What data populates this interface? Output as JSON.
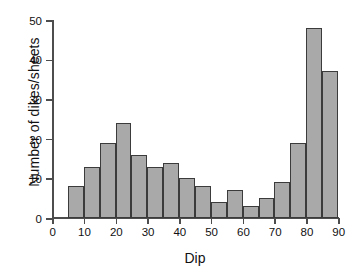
{
  "chart_data": {
    "type": "bar",
    "title": "",
    "subtitle": "",
    "xlabel": "Dip",
    "ylabel": "Number of dikes/sheets",
    "xlim": [
      0,
      90
    ],
    "ylim": [
      0,
      50
    ],
    "xticks": [
      0,
      10,
      20,
      30,
      40,
      50,
      60,
      70,
      80,
      90
    ],
    "yticks": [
      0,
      10,
      20,
      30,
      40,
      50
    ],
    "xtick_labels": [
      "0",
      "10",
      "20",
      "30",
      "40",
      "50",
      "60",
      "70",
      "80",
      "90"
    ],
    "ytick_labels": [
      "0",
      "10",
      "20",
      "30",
      "40",
      "50"
    ],
    "grid": false,
    "legend": null,
    "bin_width": 5,
    "bin_edges": [
      5,
      10,
      15,
      20,
      25,
      30,
      35,
      40,
      45,
      50,
      55,
      60,
      65,
      70,
      75,
      80,
      85,
      90
    ],
    "categories": [
      "5-10",
      "10-15",
      "15-20",
      "20-25",
      "25-30",
      "30-35",
      "35-40",
      "40-45",
      "45-50",
      "50-55",
      "55-60",
      "60-65",
      "65-70",
      "70-75",
      "75-80",
      "80-85",
      "85-90"
    ],
    "values": [
      8,
      13,
      19,
      24,
      16,
      13,
      14,
      10,
      8,
      4,
      7,
      3,
      5,
      9,
      19,
      48,
      37
    ],
    "bar_fill_color": "#a9a9a9",
    "bar_edge_color": "#3b3b3b",
    "axis_color": "#4d4d4d"
  }
}
